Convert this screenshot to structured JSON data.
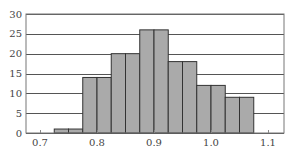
{
  "chart_data": {
    "type": "bar",
    "subtype": "histogram",
    "title": "",
    "xlabel": "",
    "ylabel": "",
    "bin_width": 0.025,
    "bin_edges": [
      0.725,
      0.75,
      0.775,
      0.8,
      0.825,
      0.85,
      0.875,
      0.9,
      0.925,
      0.95,
      0.975,
      1.0,
      1.025,
      1.05,
      1.075
    ],
    "categories": [
      "0.725-0.75",
      "0.75-0.775",
      "0.775-0.8",
      "0.8-0.825",
      "0.825-0.85",
      "0.85-0.875",
      "0.875-0.9",
      "0.9-0.925",
      "0.925-0.95",
      "0.95-0.975",
      "0.975-1.0",
      "1.0-1.025",
      "1.025-1.05",
      "1.05-1.075"
    ],
    "values": [
      1,
      1,
      14,
      14,
      20,
      20,
      26,
      26,
      18,
      18,
      12,
      12,
      9,
      9
    ],
    "xlim": [
      0.675,
      1.125
    ],
    "ylim": [
      0,
      30
    ],
    "xticks": [
      0.7,
      0.8,
      0.9,
      1.0,
      1.1
    ],
    "xtick_labels": [
      "0.7",
      "0.8",
      "0.9",
      "1.0",
      "1.1"
    ],
    "yticks": [
      0,
      5,
      10,
      15,
      20,
      25,
      30
    ],
    "ytick_labels": [
      "0",
      "5",
      "10",
      "15",
      "20",
      "25",
      "30"
    ],
    "grid": "horizontal",
    "legend": null,
    "colors": {
      "bar_fill": "#aaaaaa",
      "bar_edge": "#333333",
      "grid": "#555555",
      "frame": "#777777",
      "text": "#444444"
    }
  }
}
